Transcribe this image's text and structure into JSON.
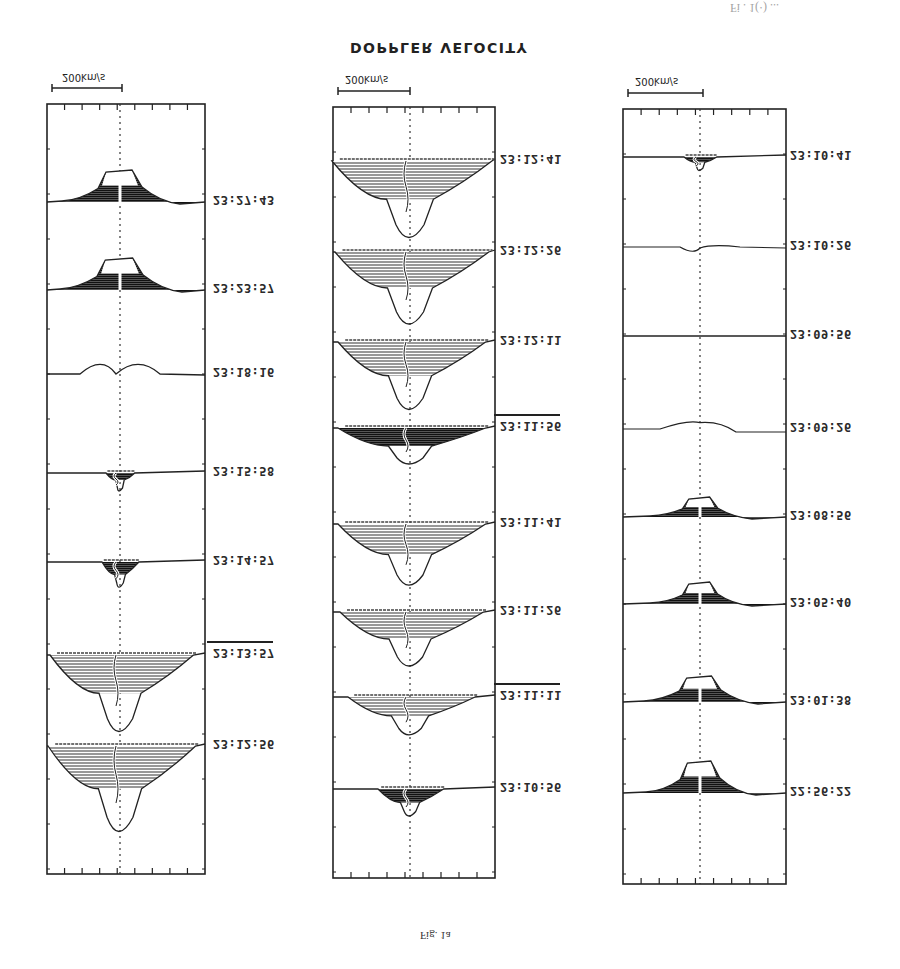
{
  "figure": {
    "title": "DOPPLER VELOCITY",
    "caption": "Fig. 1a",
    "top_fragment": "Fi . 1(·) ...",
    "scale_bar_label": "200km/s",
    "orientation": "vertically flipped"
  },
  "panels": [
    {
      "id": "left",
      "scale_label": "200km/s",
      "profiles": [
        {
          "time": "23:27:43",
          "type": "emission",
          "amp": 30,
          "width": 40,
          "overline": false
        },
        {
          "time": "23:23:57",
          "type": "emission",
          "amp": 30,
          "width": 42,
          "overline": false
        },
        {
          "time": "23:18:16",
          "type": "double-peak",
          "amp": 12,
          "width": 30,
          "overline": false
        },
        {
          "time": "23:15:58",
          "type": "small-absorption",
          "amp": 20,
          "width": 14,
          "overline": false
        },
        {
          "time": "23:14:57",
          "type": "absorption",
          "amp": 28,
          "width": 18,
          "overline": false
        },
        {
          "time": "23:13:57",
          "type": "deep-absorption",
          "amp": 85,
          "width": 70,
          "overline": true
        },
        {
          "time": "23:12:56",
          "type": "deep-absorption",
          "amp": 95,
          "width": 72,
          "overline": false
        }
      ]
    },
    {
      "id": "middle",
      "scale_label": "200km/s",
      "profiles": [
        {
          "time": "23:12:41",
          "type": "deep-absorption",
          "amp": 85,
          "width": 78,
          "overline": false
        },
        {
          "time": "23:12:26",
          "type": "deep-absorption",
          "amp": 80,
          "width": 75,
          "overline": false
        },
        {
          "time": "23:12:11",
          "type": "deep-absorption",
          "amp": 75,
          "width": 72,
          "overline": false
        },
        {
          "time": "23:11:56",
          "type": "broad-absorption",
          "amp": 40,
          "width": 72,
          "overline": true
        },
        {
          "time": "23:11:41",
          "type": "deep-absorption",
          "amp": 68,
          "width": 72,
          "overline": false
        },
        {
          "time": "23:11:26",
          "type": "deep-absorption",
          "amp": 60,
          "width": 70,
          "overline": false
        },
        {
          "time": "23:11:11",
          "type": "absorption",
          "amp": 42,
          "width": 62,
          "overline": true
        },
        {
          "time": "23:10:56",
          "type": "absorption",
          "amp": 30,
          "width": 32,
          "overline": false
        }
      ]
    },
    {
      "id": "right",
      "scale_label": "200km/s",
      "profiles": [
        {
          "time": "23:10:41",
          "type": "small-absorption",
          "amp": 15,
          "width": 16,
          "overline": false
        },
        {
          "time": "23:10:26",
          "type": "flat-dip",
          "amp": 5,
          "width": 20,
          "overline": false
        },
        {
          "time": "23:09:56",
          "type": "flat",
          "amp": 0,
          "width": 0,
          "overline": false
        },
        {
          "time": "23:09:26",
          "type": "flat-bump",
          "amp": 8,
          "width": 40,
          "overline": false
        },
        {
          "time": "23:08:56",
          "type": "emission",
          "amp": 18,
          "width": 32,
          "overline": false
        },
        {
          "time": "23:05:40",
          "type": "emission",
          "amp": 20,
          "width": 32,
          "overline": false
        },
        {
          "time": "23:01:38",
          "type": "emission",
          "amp": 24,
          "width": 38,
          "overline": false
        },
        {
          "time": "22:56:22",
          "type": "emission",
          "amp": 30,
          "width": 36,
          "overline": false
        }
      ]
    }
  ]
}
